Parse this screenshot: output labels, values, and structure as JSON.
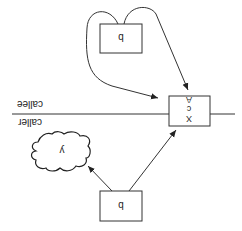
{
  "diagram": {
    "orientation": "rotated-180",
    "labels": {
      "callee": "callee",
      "caller": "caller"
    },
    "top_box": {
      "label": "b"
    },
    "bottom_box": {
      "label": "b"
    },
    "cloud": {
      "label": "y"
    },
    "stack_frame": {
      "rows": [
        "A",
        "c",
        "X"
      ]
    }
  }
}
